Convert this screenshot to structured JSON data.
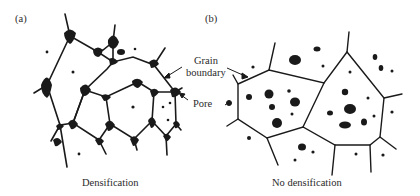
{
  "panels": [
    {
      "id": "a",
      "label": "(a)",
      "caption": "Densification"
    },
    {
      "id": "b",
      "label": "(b)",
      "caption": "No densification"
    }
  ],
  "annotations": {
    "grain_boundary_line1": "Grain",
    "grain_boundary_line2": "boundary",
    "pore": "Pore"
  },
  "colors": {
    "ink": "#1a1a1a",
    "background": "#ffffff"
  }
}
